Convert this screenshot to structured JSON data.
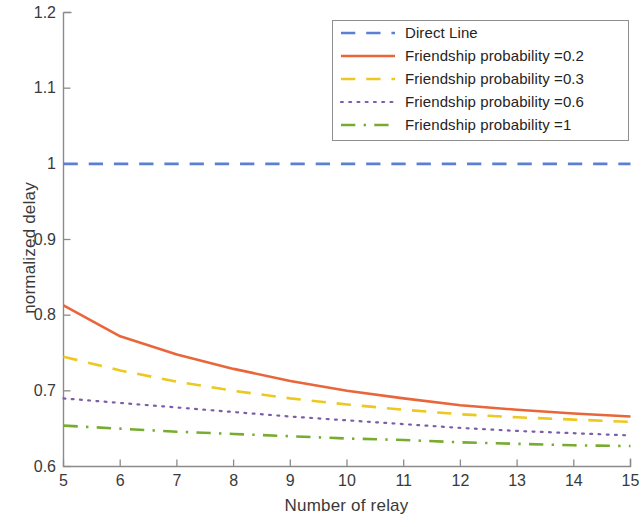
{
  "chart_data": {
    "type": "line",
    "title": "",
    "xlabel": "Number of relay",
    "ylabel": "normalized delay",
    "xlim": [
      5,
      15
    ],
    "ylim": [
      0.6,
      1.2
    ],
    "xticks": [
      5,
      6,
      7,
      8,
      9,
      10,
      11,
      12,
      13,
      14,
      15
    ],
    "xticklabels": [
      "5",
      "6",
      "7",
      "8",
      "9",
      "10",
      "11",
      "12",
      "13",
      "14",
      "15"
    ],
    "yticks": [
      0.6,
      0.7,
      0.8,
      0.9,
      1.0,
      1.1,
      1.2
    ],
    "yticklabels": [
      "0.6",
      "0.7",
      "0.8",
      "0.9",
      "1",
      "1.1",
      "1.2"
    ],
    "grid": false,
    "legend_position": "upper right",
    "x": [
      5,
      6,
      7,
      8,
      9,
      10,
      11,
      12,
      13,
      14,
      15
    ],
    "series": [
      {
        "name": "Direct Line",
        "color": "#5a7fd4",
        "style": "dashed",
        "values": [
          1.0,
          1.0,
          1.0,
          1.0,
          1.0,
          1.0,
          1.0,
          1.0,
          1.0,
          1.0,
          1.0
        ]
      },
      {
        "name": "Friendship probability =0.2",
        "color": "#e8663a",
        "style": "solid",
        "values": [
          0.813,
          0.772,
          0.748,
          0.729,
          0.713,
          0.7,
          0.69,
          0.681,
          0.675,
          0.67,
          0.666
        ]
      },
      {
        "name": "Friendship probability =0.3",
        "color": "#edc81e",
        "style": "dashed",
        "values": [
          0.745,
          0.727,
          0.712,
          0.7,
          0.69,
          0.682,
          0.675,
          0.669,
          0.665,
          0.662,
          0.659
        ]
      },
      {
        "name": "Friendship probability =0.6",
        "color": "#7b5ea7",
        "style": "dotted",
        "values": [
          0.69,
          0.684,
          0.678,
          0.672,
          0.666,
          0.661,
          0.656,
          0.651,
          0.647,
          0.644,
          0.641
        ]
      },
      {
        "name": "Friendship probability =1",
        "color": "#77ac30",
        "style": "dashdot",
        "values": [
          0.654,
          0.65,
          0.646,
          0.643,
          0.64,
          0.637,
          0.635,
          0.632,
          0.63,
          0.628,
          0.627
        ]
      }
    ]
  },
  "legend": {
    "entries": [
      {
        "label": "Direct Line"
      },
      {
        "label": "Friendship probability =0.2"
      },
      {
        "label": "Friendship probability =0.3"
      },
      {
        "label": "Friendship probability =0.6"
      },
      {
        "label": "Friendship probability =1"
      }
    ]
  },
  "axes": {
    "xlabel": "Number of relay",
    "ylabel": "normalized delay"
  }
}
